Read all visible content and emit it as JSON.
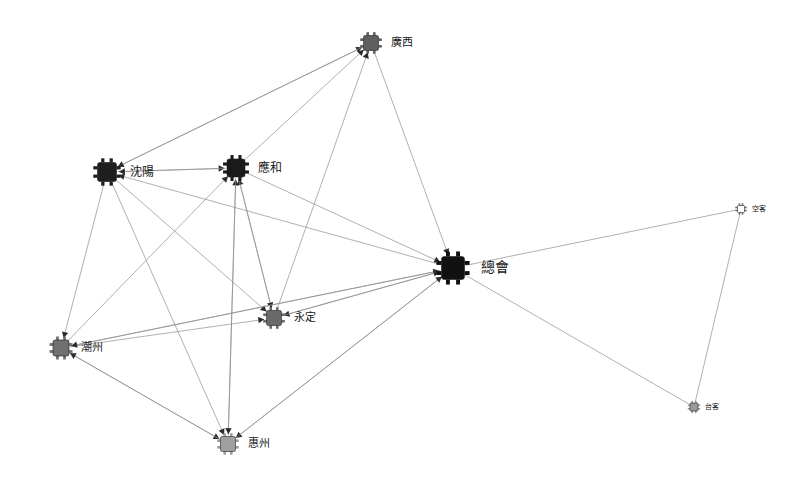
{
  "graph": {
    "title": "Organization Network Graph",
    "background_color": "#ffffff",
    "edge_color": "#8e8e8e",
    "arrow_color": "#2b2b2b",
    "label_color": "#161616",
    "node_icon": "network-device-icon",
    "nodes": [
      {
        "id": "guangxi",
        "label": "廣西",
        "x": 371,
        "y": 43,
        "size": 15,
        "fill": "#5f5f5f",
        "label_dx": 12,
        "label_dy": 0,
        "font_size": 11
      },
      {
        "id": "shenyang",
        "label": "沈陽",
        "x": 107,
        "y": 172,
        "size": 19,
        "fill": "#1f1f1f",
        "label_dx": 13,
        "label_dy": 0,
        "font_size": 12
      },
      {
        "id": "yinghe",
        "label": "應和",
        "x": 236,
        "y": 168,
        "size": 18,
        "fill": "#1a1a1a",
        "label_dx": 13,
        "label_dy": 0,
        "font_size": 12
      },
      {
        "id": "zonghui",
        "label": "總會",
        "x": 453,
        "y": 268,
        "size": 23,
        "fill": "#111111",
        "label_dx": 16,
        "label_dy": 0,
        "font_size": 14
      },
      {
        "id": "yongding",
        "label": "永定",
        "x": 274,
        "y": 318,
        "size": 15,
        "fill": "#6a6a6a",
        "label_dx": 12,
        "label_dy": 0,
        "font_size": 11
      },
      {
        "id": "chaozhou",
        "label": "潮州",
        "x": 61,
        "y": 348,
        "size": 16,
        "fill": "#707070",
        "label_dx": 12,
        "label_dy": 0,
        "font_size": 11
      },
      {
        "id": "huizhou",
        "label": "惠州",
        "x": 228,
        "y": 444,
        "size": 15,
        "fill": "#a0a0a0",
        "label_dx": 12,
        "label_dy": 0,
        "font_size": 11
      },
      {
        "id": "kongke",
        "label": "空客",
        "x": 741,
        "y": 209,
        "size": 7,
        "fill": "#ffffff",
        "label_dx": 7,
        "label_dy": 0,
        "font_size": 7
      },
      {
        "id": "taike",
        "label": "台客",
        "x": 694,
        "y": 407,
        "size": 8,
        "fill": "#9a9a9a",
        "label_dx": 7,
        "label_dy": 0,
        "font_size": 7
      }
    ],
    "edges": [
      {
        "from": "shenyang",
        "to": "guangxi",
        "directed": true
      },
      {
        "from": "yinghe",
        "to": "guangxi",
        "directed": true
      },
      {
        "from": "yongding",
        "to": "guangxi",
        "directed": true
      },
      {
        "from": "guangxi",
        "to": "zonghui",
        "directed": true
      },
      {
        "from": "guangxi",
        "to": "shenyang",
        "directed": true
      },
      {
        "from": "shenyang",
        "to": "yinghe",
        "directed": true
      },
      {
        "from": "chaozhou",
        "to": "yinghe",
        "directed": true
      },
      {
        "from": "huizhou",
        "to": "yinghe",
        "directed": true
      },
      {
        "from": "yongding",
        "to": "yinghe",
        "directed": true
      },
      {
        "from": "yinghe",
        "to": "shenyang",
        "directed": true
      },
      {
        "from": "zonghui",
        "to": "shenyang",
        "directed": true
      },
      {
        "from": "shenyang",
        "to": "chaozhou",
        "directed": true
      },
      {
        "from": "shenyang",
        "to": "yongding",
        "directed": true
      },
      {
        "from": "shenyang",
        "to": "huizhou",
        "directed": true
      },
      {
        "from": "yinghe",
        "to": "yongding",
        "directed": true
      },
      {
        "from": "yinghe",
        "to": "huizhou",
        "directed": true
      },
      {
        "from": "yinghe",
        "to": "zonghui",
        "directed": true
      },
      {
        "from": "chaozhou",
        "to": "yongding",
        "directed": true
      },
      {
        "from": "chaozhou",
        "to": "zonghui",
        "directed": true
      },
      {
        "from": "zonghui",
        "to": "yongding",
        "directed": true
      },
      {
        "from": "zonghui",
        "to": "chaozhou",
        "directed": true
      },
      {
        "from": "zonghui",
        "to": "huizhou",
        "directed": true
      },
      {
        "from": "yongding",
        "to": "zonghui",
        "directed": true
      },
      {
        "from": "huizhou",
        "to": "zonghui",
        "directed": true
      },
      {
        "from": "chaozhou",
        "to": "huizhou",
        "directed": true
      },
      {
        "from": "huizhou",
        "to": "chaozhou",
        "directed": true
      },
      {
        "from": "zonghui",
        "to": "kongke",
        "directed": false
      },
      {
        "from": "zonghui",
        "to": "taike",
        "directed": false
      },
      {
        "from": "kongke",
        "to": "taike",
        "directed": false
      }
    ]
  }
}
